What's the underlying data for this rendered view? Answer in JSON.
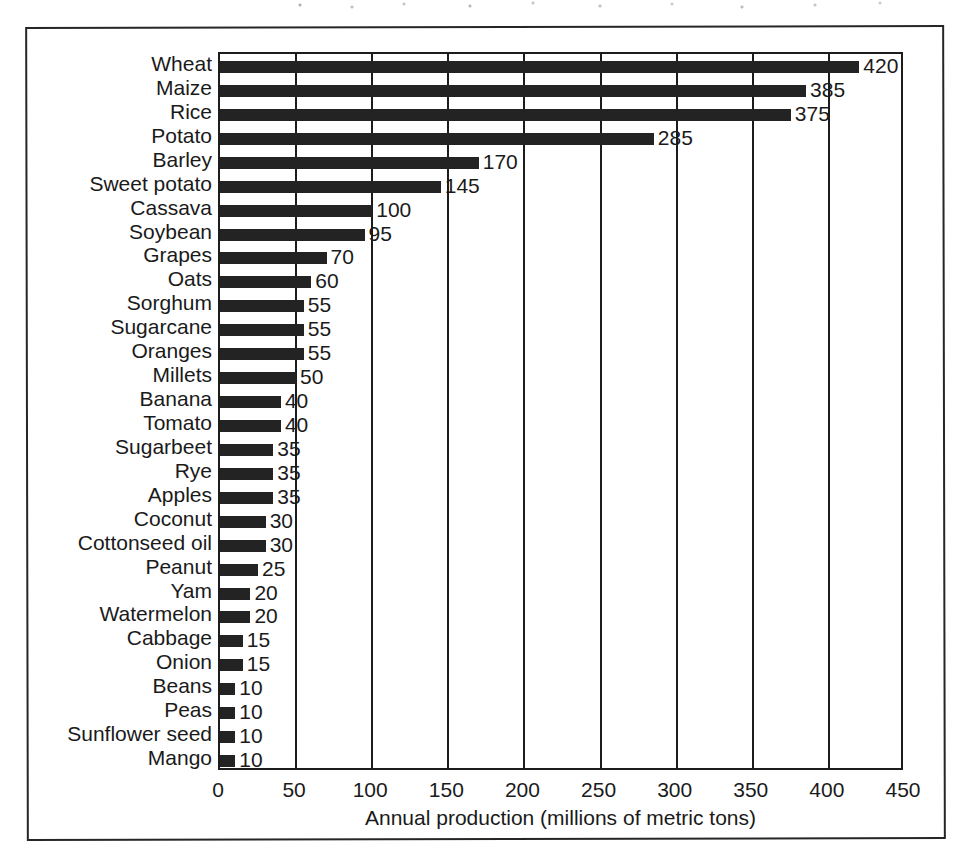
{
  "figure": {
    "border_color": "#262626",
    "background": "#ffffff"
  },
  "chart_data": {
    "type": "bar",
    "orientation": "horizontal",
    "title": "",
    "xlabel": "Annual production (millions of metric tons)",
    "ylabel": "",
    "xlim": [
      0,
      450
    ],
    "xticks": [
      0,
      50,
      100,
      150,
      200,
      250,
      300,
      350,
      400,
      450
    ],
    "xtick_labels": [
      "0",
      "50",
      "100",
      "150",
      "200",
      "250",
      "300",
      "350",
      "400",
      "450"
    ],
    "grid": "vertical-only",
    "legend": "none",
    "bar_color": "#232323",
    "value_labels_shown": true,
    "categories": [
      "Wheat",
      "Maize",
      "Rice",
      "Potato",
      "Barley",
      "Sweet potato",
      "Cassava",
      "Soybean",
      "Grapes",
      "Oats",
      "Sorghum",
      "Sugarcane",
      "Oranges",
      "Millets",
      "Banana",
      "Tomato",
      "Sugarbeet",
      "Rye",
      "Apples",
      "Coconut",
      "Cottonseed oil",
      "Peanut",
      "Yam",
      "Watermelon",
      "Cabbage",
      "Onion",
      "Beans",
      "Peas",
      "Sunflower seed",
      "Mango"
    ],
    "values": [
      420,
      385,
      375,
      285,
      170,
      145,
      100,
      95,
      70,
      60,
      55,
      55,
      55,
      50,
      40,
      40,
      35,
      35,
      35,
      30,
      30,
      25,
      20,
      20,
      15,
      15,
      10,
      10,
      10,
      10
    ],
    "value_label_text": [
      "420",
      "385",
      "375",
      "285",
      "170",
      "145",
      "100",
      "95",
      "70",
      "60",
      "55",
      "55",
      "55",
      "50",
      "40",
      "40",
      "35",
      "35",
      "35",
      "30",
      "30",
      "25",
      "20",
      "20",
      "15",
      "15",
      "10",
      "10",
      "10",
      "10"
    ]
  }
}
